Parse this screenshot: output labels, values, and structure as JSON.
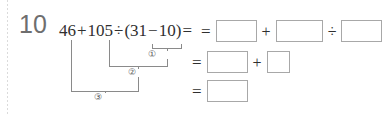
{
  "problem": {
    "number": "10",
    "expression": {
      "full": "46+105÷(31−10)=",
      "tokens": [
        "46",
        "+",
        "105",
        "÷",
        "(",
        "31",
        "−",
        "10",
        ")",
        "="
      ],
      "operand_1": "46",
      "plus": "+",
      "operand_2": "105",
      "divide": "÷",
      "paren_open": "(",
      "operand_3": "31",
      "minus": "−",
      "operand_4": "10",
      "paren_close": ")",
      "equals": "="
    }
  },
  "order_of_operations": {
    "steps": [
      {
        "label": "①",
        "describes": "31−10"
      },
      {
        "label": "②",
        "describes": "105÷(31−10)"
      },
      {
        "label": "③",
        "describes": "46+105÷(31−10)"
      }
    ]
  },
  "answer_rows": [
    {
      "equals": "=",
      "cells": [
        {
          "kind": "blank",
          "value": "",
          "size": "medium"
        },
        {
          "kind": "operator",
          "value": "+"
        },
        {
          "kind": "blank",
          "value": "",
          "size": "wide"
        },
        {
          "kind": "operator",
          "value": "÷"
        },
        {
          "kind": "blank",
          "value": "",
          "size": "medium"
        }
      ]
    },
    {
      "equals": "=",
      "cells": [
        {
          "kind": "blank",
          "value": "",
          "size": "medium"
        },
        {
          "kind": "operator",
          "value": "+"
        },
        {
          "kind": "blank",
          "value": "",
          "size": "square"
        }
      ]
    },
    {
      "equals": "=",
      "cells": [
        {
          "kind": "blank",
          "value": "",
          "size": "medium"
        }
      ]
    }
  ],
  "colors": {
    "ink": "#2f2f2f",
    "number_gray": "#6e6e6e",
    "blank_border": "#a8a8a8",
    "bracket": "#8a8a8a",
    "margin_rule": "#cfcfcf",
    "page": "#ffffff"
  }
}
